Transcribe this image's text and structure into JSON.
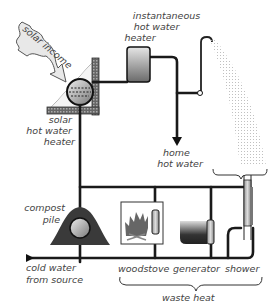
{
  "diagram": {
    "type": "home water heating system schematic",
    "labels": {
      "solar_income": "solar income",
      "instantaneous_heater": [
        "instantaneous",
        "hot water",
        "heater"
      ],
      "solar_heater": [
        "solar",
        "hot water",
        "heater"
      ],
      "home_hot_water": [
        "home",
        "hot water"
      ],
      "compost_pile": [
        "compost",
        "pile"
      ],
      "cold_water": [
        "cold water",
        "from source"
      ],
      "woodstove": "woodstove",
      "generator": "generator",
      "shower": "shower",
      "waste_heat": "waste heat"
    },
    "colors": {
      "pipe": "#1a1a1a",
      "heater_fill_top": "#e0e0e0",
      "heater_fill_bottom": "#707070",
      "compost": "#3a3a3a",
      "text": "#444444",
      "spray": "#b5b5b5"
    }
  }
}
